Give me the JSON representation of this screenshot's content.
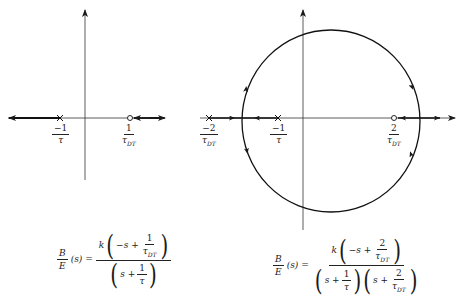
{
  "figure": {
    "left_plot": {
      "description": "Root locus for first-order system with right-half-plane zero",
      "poles": [
        {
          "label_num": "−1",
          "label_den": "τ",
          "x_px": 60
        }
      ],
      "zeros": [
        {
          "label_num": "1",
          "label_den": "τDT",
          "x_px": 130
        }
      ],
      "transfer_function": {
        "lhs_num": "B",
        "lhs_den": "E",
        "lhs_arg": "(s)",
        "equals": "=",
        "gain": "k",
        "num_inner": "−s +",
        "num_frac_num": "1",
        "num_frac_den": "τ",
        "num_frac_den_sub": "DT",
        "den_inner": "s +",
        "den_frac_num": "1",
        "den_frac_den": "τ"
      }
    },
    "right_plot": {
      "description": "Root locus with additional pole, circular locus",
      "poles": [
        {
          "label_num": "−2",
          "label_den": "τDT",
          "x_px": 209
        },
        {
          "label_num": "−1",
          "label_den": "τ",
          "x_px": 278
        }
      ],
      "zeros": [
        {
          "label_num": "2",
          "label_den": "τDT",
          "x_px": 394
        }
      ],
      "transfer_function": {
        "lhs_num": "B",
        "lhs_den": "E",
        "lhs_arg": "(s)",
        "equals": "=",
        "gain": "k",
        "num_inner": "−s +",
        "num_frac_num": "2",
        "num_frac_den": "τ",
        "num_frac_den_sub": "DT",
        "den1_inner": "s +",
        "den1_frac_num": "1",
        "den1_frac_den": "τ",
        "den2_inner": "s +",
        "den2_frac_num": "2",
        "den2_frac_den": "τ",
        "den2_frac_den_sub": "DT"
      }
    },
    "labels": {
      "l_pole_num": "−1",
      "l_pole_den": "τ",
      "l_zero_num": "1",
      "l_zero_den": "τ",
      "l_zero_sub": "DT",
      "r_pole1_num": "−2",
      "r_pole1_den": "τ",
      "r_pole1_sub": "DT",
      "r_pole2_num": "−1",
      "r_pole2_den": "τ",
      "r_zero_num": "2",
      "r_zero_den": "τ",
      "r_zero_sub": "DT"
    },
    "colors": {
      "ink": "#1a1a1a",
      "background": "#ffffff"
    }
  }
}
